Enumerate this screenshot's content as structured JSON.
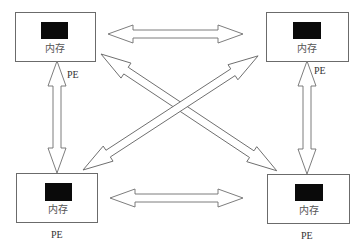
{
  "diagram": {
    "type": "multiprocessor-interconnect",
    "nodes": [
      {
        "id": "top-left",
        "memory_label": "内存",
        "pe_label": "PE"
      },
      {
        "id": "top-right",
        "memory_label": "内存",
        "pe_label": "PE"
      },
      {
        "id": "bottom-left",
        "memory_label": "内存",
        "pe_label": "PE"
      },
      {
        "id": "bottom-right",
        "memory_label": "内存",
        "pe_label": "PE"
      }
    ],
    "edges": [
      {
        "from": "top-left",
        "to": "top-right",
        "style": "double-arrow"
      },
      {
        "from": "bottom-left",
        "to": "bottom-right",
        "style": "double-arrow"
      },
      {
        "from": "top-left",
        "to": "bottom-left",
        "style": "double-arrow"
      },
      {
        "from": "top-right",
        "to": "bottom-right",
        "style": "double-arrow"
      },
      {
        "from": "top-left",
        "to": "bottom-right",
        "style": "double-arrow"
      },
      {
        "from": "bottom-left",
        "to": "top-right",
        "style": "double-arrow"
      }
    ],
    "colors": {
      "outline": "#6b6b6b",
      "memory_block": "#0a0a0a",
      "background": "#ffffff"
    }
  }
}
